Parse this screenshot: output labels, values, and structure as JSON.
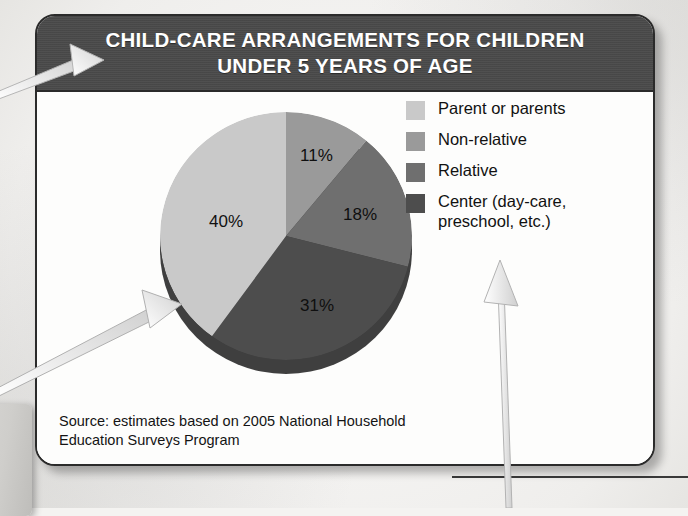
{
  "card": {
    "title_line_1": "CHILD-CARE ARRANGEMENTS FOR CHILDREN",
    "title_line_2": "UNDER 5 YEARS OF AGE",
    "header_bg": "#4a4a4a",
    "border_color": "#2b2b2b",
    "body_bg": "#fdfdfc",
    "source_line_1": "Source: estimates based on 2005 National Household",
    "source_line_2": "Education Surveys Program"
  },
  "legend": {
    "items": [
      {
        "label": "Parent or parents",
        "color": "#c9c9c9"
      },
      {
        "label": "Non-relative",
        "color": "#9a9a9a"
      },
      {
        "label": "Relative",
        "color": "#6f6f6f"
      },
      {
        "label": "Center (day-care, preschool, etc.)",
        "color": "#4d4d4d"
      }
    ]
  },
  "annotations": {
    "arrow_to_title": "arrow-pointing-to-title",
    "arrow_to_slice": "arrow-pointing-to-parent-slice",
    "arrow_to_legend": "arrow-pointing-to-legend"
  },
  "chart_data": {
    "type": "pie",
    "title": "CHILD-CARE ARRANGEMENTS FOR CHILDREN UNDER 5 YEARS OF AGE",
    "xlabel": "",
    "ylabel": "",
    "legend_position": "right",
    "grid": false,
    "units": "percent",
    "categories": [
      "Parent or parents",
      "Non-relative",
      "Relative",
      "Center (day-care, preschool, etc.)"
    ],
    "values": [
      40,
      11,
      18,
      31
    ],
    "data_labels": [
      "40%",
      "11%",
      "18%",
      "31%"
    ],
    "colors": [
      "#c9c9c9",
      "#9a9a9a",
      "#6f6f6f",
      "#4d4d4d"
    ],
    "start_angle_deg": 0,
    "direction": "clockwise",
    "slice_order_from_12_oclock_clockwise": [
      "Non-relative",
      "Relative",
      "Center (day-care, preschool, etc.)",
      "Parent or parents"
    ],
    "source": "estimates based on 2005 National Household Education Surveys Program"
  }
}
